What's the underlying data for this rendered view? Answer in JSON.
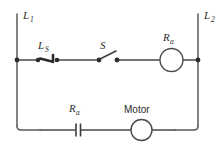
{
  "figure": {
    "type": "ladder-circuit-diagram",
    "background_color": "#ffffff",
    "line_color": "#4a4a4a",
    "text_color": "#2b2b2b"
  },
  "rails": {
    "left": {
      "label_main": "L",
      "label_sub": "1",
      "full_label": "L1"
    },
    "right": {
      "label_main": "L",
      "label_sub": "2",
      "full_label": "L2"
    }
  },
  "rungs": [
    {
      "name": "control-rung",
      "components": [
        {
          "name": "limit-switch",
          "symbol": "limit-switch-icon",
          "label_main": "L",
          "label_sub": "S",
          "full_label": "LS"
        },
        {
          "name": "switch",
          "symbol": "open-switch-icon",
          "label_main": "S",
          "label_sub": "",
          "full_label": "S"
        },
        {
          "name": "relay-coil",
          "symbol": "coil-circle-icon",
          "label_main": "R",
          "label_sub": "a",
          "full_label": "Ra"
        }
      ]
    },
    {
      "name": "power-rung",
      "components": [
        {
          "name": "relay-contact",
          "symbol": "normally-open-contact-icon",
          "label_main": "R",
          "label_sub": "a",
          "full_label": "Ra"
        },
        {
          "name": "motor",
          "symbol": "motor-circle-icon",
          "label_main": "Motor",
          "label_sub": "",
          "full_label": "Motor"
        }
      ]
    }
  ]
}
